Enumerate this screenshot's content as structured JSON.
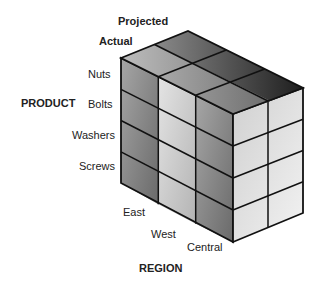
{
  "diagram": {
    "type": "olap-cube",
    "axes": {
      "product": {
        "title": "PRODUCT",
        "members": [
          "Nuts",
          "Bolts",
          "Washers",
          "Screws"
        ]
      },
      "region": {
        "title": "REGION",
        "members": [
          "East",
          "West",
          "Central"
        ]
      },
      "measure": {
        "members": [
          "Actual",
          "Projected"
        ]
      }
    },
    "colors": {
      "edge": "#111111",
      "left_face_light": "#9a9a9a",
      "left_face_dark": "#6e6e6e",
      "right_face_light": "#e6e6e6",
      "right_face_dark": "#b8b8b8",
      "top_face_light": "#a8a8a8",
      "top_face_dark": "#2a2a2a"
    }
  }
}
